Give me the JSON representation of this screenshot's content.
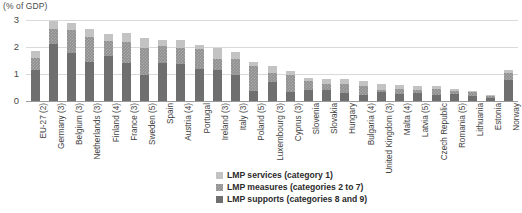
{
  "axis_title": "(% of GDP)",
  "legend": {
    "items": [
      {
        "label": "LMP services (category 1)",
        "key": "services",
        "color": "#c3c3c3"
      },
      {
        "label": "LMP measures (categories 2 to 7)",
        "key": "measures",
        "color": "#8f8f8f"
      },
      {
        "label": "LMP supports (categories 8 and 9)",
        "key": "supports",
        "color": "#6f6f6f"
      }
    ]
  },
  "chart_data": {
    "type": "bar",
    "subtype": "stacked-column",
    "title": "",
    "xlabel": "",
    "ylabel": "(% of GDP)",
    "ylim": [
      0,
      3
    ],
    "yticks": [
      0,
      1,
      2,
      3
    ],
    "grid": true,
    "legend_position": "bottom-center",
    "categories": [
      "EU-27 (2)",
      "Germany (3)",
      "Belgium (3)",
      "Netherlands (3)",
      "Finland (4)",
      "France (3)",
      "Sweden (5)",
      "Spain",
      "Austria (4)",
      "Portugal",
      "Ireland (3)",
      "Italy (3)",
      "Poland (5)",
      "Luxembourg (3)",
      "Cyprus (3)",
      "Slovenia",
      "Slovakia",
      "Hungary",
      "Bulgaria (4)",
      "United Kingdom (3)",
      "Malta (4)",
      "Latvia (5)",
      "Czech Republic",
      "Romania (5)",
      "Lithuania",
      "Estonia",
      "Norway"
    ],
    "series": [
      {
        "name": "LMP supports (categories 8 and 9)",
        "color": "#6f6f6f",
        "values": [
          1.15,
          2.1,
          1.78,
          1.45,
          1.68,
          1.42,
          0.95,
          1.42,
          1.38,
          1.18,
          1.15,
          0.95,
          0.38,
          0.72,
          0.35,
          0.42,
          0.4,
          0.3,
          0.22,
          0.32,
          0.25,
          0.3,
          0.22,
          0.26,
          0.2,
          0.12,
          0.78
        ]
      },
      {
        "name": "LMP measures (categories 2 to 7)",
        "color": "#8f8f8f",
        "values": [
          0.45,
          0.55,
          0.85,
          0.92,
          0.56,
          0.75,
          1.0,
          0.62,
          0.6,
          0.73,
          0.42,
          0.62,
          0.92,
          0.32,
          0.6,
          0.32,
          0.22,
          0.32,
          0.35,
          0.1,
          0.2,
          0.1,
          0.22,
          0.12,
          0.12,
          0.08,
          0.26
        ]
      },
      {
        "name": "LMP services (category 1)",
        "color": "#c3c3c3",
        "values": [
          0.25,
          0.3,
          0.25,
          0.3,
          0.26,
          0.35,
          0.38,
          0.22,
          0.28,
          0.16,
          0.38,
          0.25,
          0.13,
          0.25,
          0.15,
          0.12,
          0.18,
          0.18,
          0.18,
          0.2,
          0.13,
          0.15,
          0.1,
          0.05,
          0.06,
          0.02,
          0.12
        ]
      }
    ],
    "totals": [
      1.85,
      2.95,
      2.88,
      2.67,
      2.5,
      2.52,
      2.33,
      2.26,
      2.26,
      2.07,
      1.95,
      1.82,
      1.43,
      1.29,
      1.1,
      0.86,
      0.8,
      0.8,
      0.75,
      0.62,
      0.58,
      0.55,
      0.54,
      0.43,
      0.38,
      0.22,
      1.16
    ]
  }
}
